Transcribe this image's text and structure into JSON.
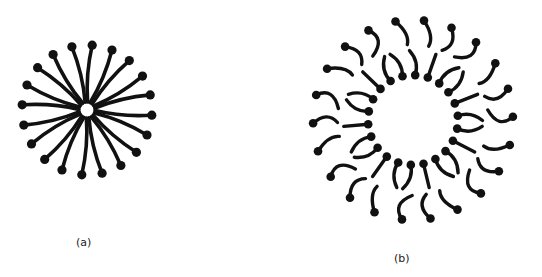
{
  "figure": {
    "panels": [
      {
        "id": "a",
        "label": "(a)",
        "structure": "micelle",
        "center": [
          87,
          110
        ],
        "core_radius": 6,
        "head_radius": 65,
        "molecule_count": 20,
        "color": "#111111"
      },
      {
        "id": "b",
        "label": "(b)",
        "structure": "bilayer-vesicle",
        "center": [
          413,
          120
        ],
        "inner_head_radius": 45,
        "outer_head_radius": 100,
        "molecule_pairs": 22,
        "color": "#111111"
      }
    ],
    "background": "#ffffff"
  }
}
